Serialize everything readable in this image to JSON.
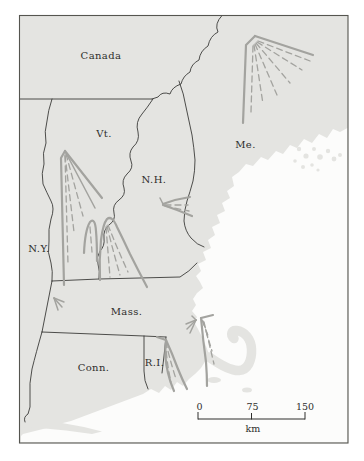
{
  "map": {
    "labels": {
      "canada": "Canada",
      "vermont": "Vt.",
      "new_hampshire": "N.H.",
      "maine": "Me.",
      "new_york": "N.Y.",
      "massachusetts": "Mass.",
      "connecticut": "Conn.",
      "rhode_island": "R.I."
    },
    "scale_bar": {
      "tick_start": "0",
      "tick_mid": "75",
      "tick_end": "150",
      "unit": "km"
    },
    "colors": {
      "land": "#e4e4e1",
      "water": "#fcfcfb",
      "state_border": "#3b3b39",
      "fan_lines": "#a3a39f",
      "frame": "#55554f",
      "text": "#2e2e2c"
    }
  }
}
